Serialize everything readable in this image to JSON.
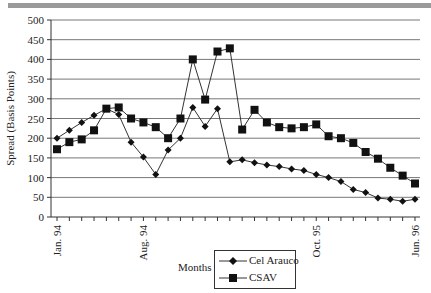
{
  "chart_data": {
    "type": "line",
    "title": "",
    "xlabel": "Months",
    "ylabel": "Spread (Basis Points)",
    "ylim": [
      0,
      500
    ],
    "yticks": [
      0,
      50,
      100,
      150,
      200,
      250,
      300,
      350,
      400,
      450,
      500
    ],
    "grid": true,
    "legend_position": "bottom-center",
    "x_tick_labels": [
      {
        "index": 0,
        "label": "Jan. 94"
      },
      {
        "index": 7,
        "label": "Aug. 94"
      },
      {
        "index": 21,
        "label": "Oct. 95"
      },
      {
        "index": 29,
        "label": "Jun. 96"
      }
    ],
    "x_count": 30,
    "series": [
      {
        "name": "Cel Arauco",
        "marker": "diamond",
        "values": [
          200,
          220,
          240,
          258,
          275,
          260,
          190,
          152,
          108,
          170,
          200,
          278,
          230,
          275,
          140,
          145,
          138,
          132,
          128,
          122,
          118,
          108,
          100,
          90,
          70,
          62,
          48,
          45,
          40,
          45
        ]
      },
      {
        "name": "CSAV",
        "marker": "square",
        "values": [
          172,
          190,
          197,
          220,
          275,
          278,
          250,
          240,
          228,
          200,
          250,
          400,
          298,
          420,
          428,
          222,
          272,
          240,
          228,
          225,
          228,
          235,
          205,
          200,
          188,
          165,
          148,
          125,
          105,
          85
        ]
      }
    ]
  },
  "legend": {
    "items": [
      {
        "label": "Cel Arauco"
      },
      {
        "label": "CSAV"
      }
    ]
  },
  "axes": {
    "x_title": "Months",
    "y_title": "Spread (Basis Points)"
  },
  "colors": {
    "line": "#333333",
    "grid": "#777777",
    "marker": "#111111"
  }
}
